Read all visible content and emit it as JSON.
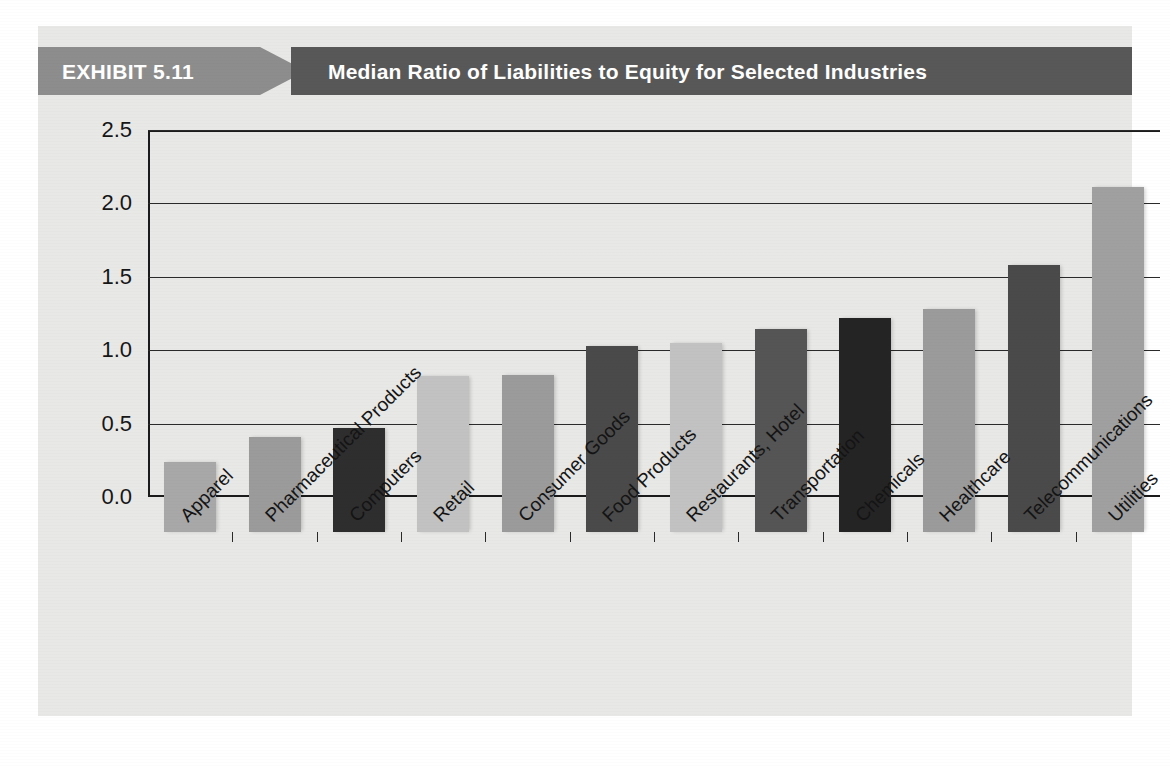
{
  "exhibit": {
    "label": "EXHIBIT 5.11",
    "title": "Median Ratio of Liabilities to Equity for Selected Industries",
    "banner_left_color": "#8d8d8d",
    "banner_right_color": "#585858",
    "banner_text_color": "#ffffff",
    "page_background": "#e8e8e6"
  },
  "chart_data": {
    "type": "bar",
    "title": "Median Ratio of Liabilities to Equity for Selected Industries",
    "xlabel": "",
    "ylabel": "",
    "ylim": [
      0.0,
      2.5
    ],
    "yticks": [
      "0.0",
      "0.5",
      "1.0",
      "1.5",
      "2.0",
      "2.5"
    ],
    "ytick_values": [
      0.0,
      0.5,
      1.0,
      1.5,
      2.0,
      2.5
    ],
    "grid": true,
    "legend": "none",
    "categories": [
      "Apparel",
      "Pharmaceutical Products",
      "Computers",
      "Retail",
      "Consumer Goods",
      "Food Products",
      "Restaurants, Hotel",
      "Transportation",
      "Chemicals",
      "Healthcare",
      "Telecommunications",
      "Utilities"
    ],
    "values": [
      0.48,
      0.65,
      0.71,
      1.06,
      1.07,
      1.27,
      1.29,
      1.38,
      1.46,
      1.52,
      1.82,
      2.35
    ],
    "bar_colors": [
      "#a8a8a8",
      "#9b9b9b",
      "#2e2e2e",
      "#c2c2c2",
      "#9b9b9b",
      "#4a4a4a",
      "#c2c2c2",
      "#555555",
      "#242424",
      "#9b9b9b",
      "#4a4a4a",
      "#a0a0a0"
    ]
  }
}
